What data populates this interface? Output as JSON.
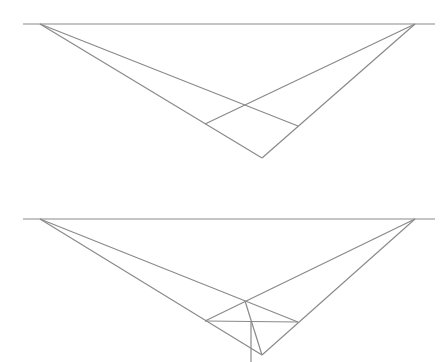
{
  "diagram": {
    "title": "",
    "stroke_color": "#8a8a8a",
    "background": "#ffffff",
    "panels": [
      {
        "name": "top-panel",
        "horizon": {
          "x1": 23,
          "y1": 24,
          "x2": 435,
          "y2": 24
        },
        "vanishing_points": {
          "left": [
            40,
            24
          ],
          "right": [
            415,
            24
          ]
        },
        "lines": [
          {
            "name": "left-vp-to-bottom",
            "x1": 40,
            "y1": 24,
            "x2": 262,
            "y2": 158
          },
          {
            "name": "right-vp-to-bottom",
            "x1": 415,
            "y1": 24,
            "x2": 262,
            "y2": 158
          },
          {
            "name": "left-vp-to-right-point",
            "x1": 40,
            "y1": 24,
            "x2": 298,
            "y2": 126
          },
          {
            "name": "right-vp-to-left-point",
            "x1": 415,
            "y1": 24,
            "x2": 205,
            "y2": 124
          }
        ]
      },
      {
        "name": "bottom-panel",
        "horizon": {
          "x1": 23,
          "y1": 219,
          "x2": 435,
          "y2": 219
        },
        "vanishing_points": {
          "left": [
            40,
            219
          ],
          "right": [
            415,
            219
          ]
        },
        "lines": [
          {
            "name": "left-vp-to-bottom",
            "x1": 40,
            "y1": 219,
            "x2": 262,
            "y2": 355
          },
          {
            "name": "right-vp-to-bottom",
            "x1": 415,
            "y1": 219,
            "x2": 262,
            "y2": 355
          },
          {
            "name": "left-vp-to-right-point",
            "x1": 40,
            "y1": 219,
            "x2": 298,
            "y2": 322
          },
          {
            "name": "right-vp-to-left-point",
            "x1": 415,
            "y1": 219,
            "x2": 205,
            "y2": 321
          },
          {
            "name": "horizontal-diagonal",
            "x1": 205,
            "y1": 321,
            "x2": 298,
            "y2": 322
          },
          {
            "name": "center-diagonal",
            "x1": 245,
            "y1": 301,
            "x2": 262,
            "y2": 355
          },
          {
            "name": "vertical-line",
            "x1": 251,
            "y1": 321,
            "x2": 251,
            "y2": 362
          }
        ]
      }
    ]
  }
}
